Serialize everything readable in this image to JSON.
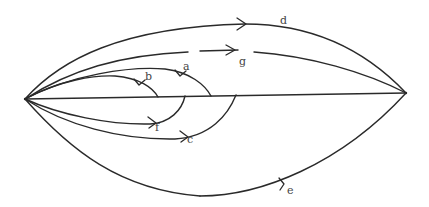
{
  "diagram": {
    "nodes": {
      "left": {
        "x": 25,
        "y": 99
      },
      "right": {
        "x": 406,
        "y": 93
      }
    },
    "colors": {
      "stroke": "#2a2a2a",
      "label": "#444444",
      "background": "#ffffff"
    },
    "curves": [
      {
        "id": "d",
        "label": "d",
        "label_pos": [
          280,
          24
        ]
      },
      {
        "id": "g",
        "label": "g",
        "label_pos": [
          239,
          65
        ]
      },
      {
        "id": "a",
        "label": "a",
        "label_pos": [
          183,
          70
        ]
      },
      {
        "id": "b",
        "label": "b",
        "label_pos": [
          145,
          80
        ]
      },
      {
        "id": "f",
        "label": "f",
        "label_pos": [
          155,
          131
        ]
      },
      {
        "id": "c",
        "label": "c",
        "label_pos": [
          187,
          143
        ]
      },
      {
        "id": "e",
        "label": "e",
        "label_pos": [
          287,
          194
        ]
      }
    ],
    "labels": {
      "a": "a",
      "b": "b",
      "c": "c",
      "d": "d",
      "e": "e",
      "f": "f",
      "g": "g"
    }
  }
}
